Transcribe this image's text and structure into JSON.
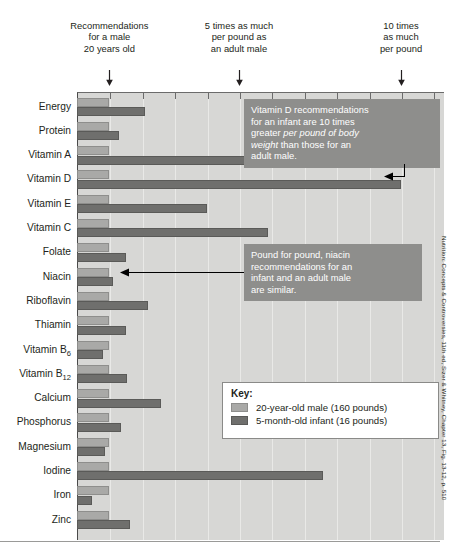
{
  "figure": {
    "source_credit": "Nutrition: Concepts & Controversies, 11th ed, Sizer & Whitney, Chapter 13, Fig. 13-12, p. 510"
  },
  "header_annotations": [
    {
      "id": "one-times",
      "text": "Recommendations\nfor a male\n20 years old",
      "axis_value": 1
    },
    {
      "id": "five-times",
      "text": "5 times as much\nper pound as\nan adult male",
      "axis_value": 5
    },
    {
      "id": "ten-times",
      "text": "10 times\nas much\nper pound",
      "axis_value": 10
    }
  ],
  "callouts": [
    {
      "id": "vitamin-d-callout",
      "target": "Vitamin D",
      "lines": [
        {
          "text": "Vitamin D recommendations",
          "italic": false
        },
        {
          "text": "for an infant are 10 times",
          "italic": false
        },
        {
          "text": "greater ",
          "italic": false,
          "cont": "per pound of body",
          "cont_italic": true
        },
        {
          "text": "weight",
          "italic": true,
          "cont": " than those for an",
          "cont_italic": false
        },
        {
          "text": "adult male.",
          "italic": false
        }
      ],
      "plain_text": "Vitamin D recommendations for an infant are 10 times greater per pound of body weight than those for an adult male."
    },
    {
      "id": "niacin-callout",
      "target": "Niacin",
      "lines": [
        {
          "text": "Pound for pound, niacin",
          "italic": false
        },
        {
          "text": "recommendations for an",
          "italic": false
        },
        {
          "text": "infant and an adult male",
          "italic": false
        },
        {
          "text": "are similar.",
          "italic": false
        }
      ],
      "plain_text": "Pound for pound, niacin recommendations for an infant and an adult male are similar."
    }
  ],
  "key": {
    "title": "Key:",
    "entries": [
      {
        "swatch": "adult",
        "label": "20-year-old male (160 pounds)",
        "color": "#a9a9a7"
      },
      {
        "swatch": "infant",
        "label": "5-month-old infant (16 pounds)",
        "color": "#6f6f6d"
      }
    ]
  },
  "chart_data": {
    "type": "bar",
    "orientation": "horizontal",
    "title": "",
    "xlabel": "Times as much per pound as an adult male",
    "ylabel": "",
    "xlim": [
      0,
      11.4
    ],
    "xticks": [
      1,
      2,
      3,
      4,
      5,
      6,
      7,
      8,
      9,
      10,
      11
    ],
    "grid": true,
    "legend_position": "inside-right",
    "categories": [
      "Energy",
      "Protein",
      "Vitamin A",
      "Vitamin D",
      "Vitamin E",
      "Vitamin C",
      "Folate",
      "Niacin",
      "Riboflavin",
      "Thiamin",
      "Vitamin B6",
      "Vitamin B12",
      "Calcium",
      "Phosphorus",
      "Magnesium",
      "Iodine",
      "Iron",
      "Zinc"
    ],
    "categories_display": [
      "Energy",
      "Protein",
      "Vitamin A",
      "Vitamin D",
      "Vitamin E",
      "Vitamin C",
      "Folate",
      "Niacin",
      "Riboflavin",
      "Thiamin",
      "Vitamin B<sub>6</sub>",
      "Vitamin B<sub>12</sub>",
      "Calcium",
      "Phosphorus",
      "Magnesium",
      "Iodine",
      "Iron",
      "Zinc"
    ],
    "series": [
      {
        "name": "20-year-old male (160 pounds)",
        "color": "#a9a9a7",
        "values": [
          1,
          1,
          1,
          1,
          1,
          1,
          1,
          1,
          1,
          1,
          1,
          1,
          1,
          1,
          1,
          1,
          1,
          1
        ]
      },
      {
        "name": "5-month-old infant (16 pounds)",
        "color": "#6f6f6d",
        "values": [
          2.1,
          1.3,
          5.5,
          10.0,
          4.0,
          5.9,
          1.5,
          1.1,
          2.2,
          1.5,
          0.8,
          1.55,
          2.6,
          1.35,
          0.85,
          7.6,
          0.45,
          1.65
        ]
      }
    ]
  }
}
